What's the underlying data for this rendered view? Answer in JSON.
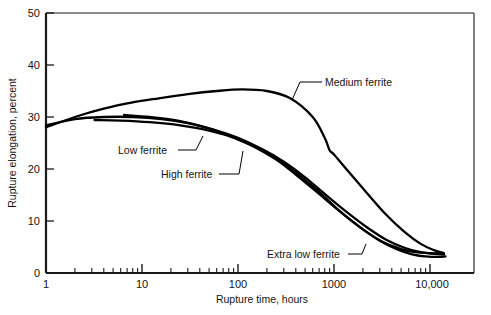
{
  "chart_data": {
    "type": "line",
    "title": "",
    "xlabel": "Rupture time, hours",
    "ylabel": "Rupture elongation, percent",
    "xscale": "log",
    "yscale": "linear",
    "xlim": [
      1,
      16000
    ],
    "ylim": [
      0,
      50
    ],
    "grid": false,
    "legend_position": "inline-annotations",
    "x_tick_labels": [
      "1",
      "10",
      "100",
      "1000",
      "10,000"
    ],
    "x_tick_values": [
      1,
      10,
      100,
      1000,
      10000
    ],
    "y_tick_labels": [
      "0",
      "10",
      "20",
      "30",
      "40",
      "50"
    ],
    "y_tick_values": [
      0,
      10,
      20,
      30,
      40,
      50
    ],
    "minor_ticks": "log decade subdivisions 2-9",
    "series": [
      {
        "name": "Medium ferrite",
        "label": "Medium ferrite",
        "points": [
          [
            1,
            28.0
          ],
          [
            2,
            30.0
          ],
          [
            4,
            31.6
          ],
          [
            8,
            32.8
          ],
          [
            15,
            33.6
          ],
          [
            30,
            34.4
          ],
          [
            60,
            35.0
          ],
          [
            110,
            35.3
          ],
          [
            200,
            35.0
          ],
          [
            350,
            33.6
          ],
          [
            600,
            30.0
          ],
          [
            800,
            26.0
          ],
          [
            900,
            23.6
          ],
          [
            1000,
            22.8
          ],
          [
            1400,
            19.6
          ],
          [
            2200,
            15.4
          ],
          [
            3500,
            11.2
          ],
          [
            5500,
            7.8
          ],
          [
            8000,
            5.6
          ],
          [
            11000,
            4.4
          ],
          [
            14000,
            3.8
          ]
        ]
      },
      {
        "name": "Low ferrite",
        "label": "Low ferrite",
        "points": [
          [
            3.2,
            29.4
          ],
          [
            6,
            29.3
          ],
          [
            12,
            29.0
          ],
          [
            25,
            28.4
          ],
          [
            50,
            27.4
          ],
          [
            100,
            25.8
          ],
          [
            180,
            23.8
          ],
          [
            300,
            21.4
          ],
          [
            500,
            18.4
          ],
          [
            800,
            15.2
          ],
          [
            1300,
            12.0
          ],
          [
            2200,
            8.8
          ],
          [
            3500,
            6.4
          ],
          [
            5500,
            4.8
          ],
          [
            8000,
            4.0
          ],
          [
            11000,
            3.7
          ],
          [
            14000,
            3.6
          ]
        ]
      },
      {
        "name": "High ferrite",
        "label": "High ferrite",
        "points": [
          [
            6.5,
            30.4
          ],
          [
            12,
            30.0
          ],
          [
            25,
            29.2
          ],
          [
            50,
            27.8
          ],
          [
            90,
            26.0
          ],
          [
            150,
            24.2
          ],
          [
            250,
            21.8
          ],
          [
            420,
            18.6
          ],
          [
            700,
            15.2
          ],
          [
            1200,
            11.6
          ],
          [
            2000,
            8.4
          ],
          [
            3200,
            6.0
          ],
          [
            5000,
            4.6
          ],
          [
            7000,
            4.0
          ],
          [
            10000,
            3.8
          ],
          [
            13500,
            3.8
          ]
        ]
      },
      {
        "name": "Extra low ferrite",
        "label": "Extra low ferrite",
        "points": [
          [
            1,
            28.4
          ],
          [
            2,
            29.6
          ],
          [
            4,
            30.0
          ],
          [
            8,
            30.0
          ],
          [
            16,
            29.6
          ],
          [
            30,
            28.8
          ],
          [
            60,
            27.4
          ],
          [
            100,
            26.0
          ],
          [
            160,
            24.2
          ],
          [
            260,
            21.8
          ],
          [
            420,
            19.0
          ],
          [
            700,
            15.6
          ],
          [
            1100,
            12.2
          ],
          [
            1800,
            9.0
          ],
          [
            3000,
            6.2
          ],
          [
            4500,
            4.6
          ],
          [
            6500,
            3.6
          ],
          [
            9000,
            3.2
          ],
          [
            12000,
            3.1
          ],
          [
            14500,
            3.2
          ]
        ]
      }
    ],
    "annotations": [
      {
        "text": "Medium ferrite",
        "text_x": 325,
        "text_y": 86,
        "anchor": "start",
        "leader": "M 322 82 L 300 82 L 292 100"
      },
      {
        "text": "Low ferrite",
        "text_x": 118,
        "text_y": 154,
        "anchor": "start",
        "leader": "M 178 150 L 196 150 L 203 136"
      },
      {
        "text": "High ferrite",
        "text_x": 161,
        "text_y": 178,
        "anchor": "start",
        "leader": "M 219 174 L 239 174 L 243 151"
      },
      {
        "text": "Extra low ferrite",
        "text_x": 267,
        "text_y": 258,
        "anchor": "start",
        "leader": "M 348 254 L 362 254 L 366 244"
      }
    ]
  },
  "axes": {
    "plot_left": 46,
    "plot_right": 474,
    "plot_top": 13,
    "plot_bottom": 273
  }
}
